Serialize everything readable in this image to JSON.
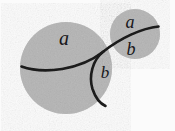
{
  "figure": {
    "background_color": "#fbfbfb",
    "disk_fill_color": "#b4b4b4",
    "disk_edge_color": "#a8a8a8",
    "curve_color": "#1a1a1a",
    "label_color": "#17171a",
    "width": 175,
    "height": 131
  },
  "shapes": {
    "large_disk": {
      "name": "large-disk",
      "cx": 66,
      "cy": 68,
      "r": 46
    },
    "small_disk": {
      "name": "small-disk",
      "cx": 135,
      "cy": 34,
      "r": 25
    }
  },
  "curves": {
    "main_arc": {
      "name": "main-arc",
      "path": "M 21.5 66.5 C 44 74.5, 80 70, 103.5 51.5 C 120 38.5, 142 28, 158.5 26.5",
      "stroke_width": 2.6
    },
    "branch_arc": {
      "name": "branch-arc",
      "path": "M 103.5 51.5 C 92.5 60, 88.5 76, 92.5 89 C 95.5 98, 100 103.5, 105.5 106",
      "stroke_width": 2.6
    }
  },
  "labels": [
    {
      "id": "label-a-large-disk",
      "text": "a",
      "x": 64,
      "y": 45,
      "font_size": 20,
      "region": "large-disk-above-arc"
    },
    {
      "id": "label-b-large-disk",
      "text": "b",
      "x": 105,
      "y": 78,
      "font_size": 17,
      "region": "large-disk-right-of-branch"
    },
    {
      "id": "label-a-small-disk",
      "text": "a",
      "x": 130,
      "y": 28,
      "font_size": 18,
      "region": "small-disk-above-arc"
    },
    {
      "id": "label-b-small-disk",
      "text": "b",
      "x": 131,
      "y": 55,
      "font_size": 18,
      "region": "small-disk-below-arc"
    }
  ]
}
